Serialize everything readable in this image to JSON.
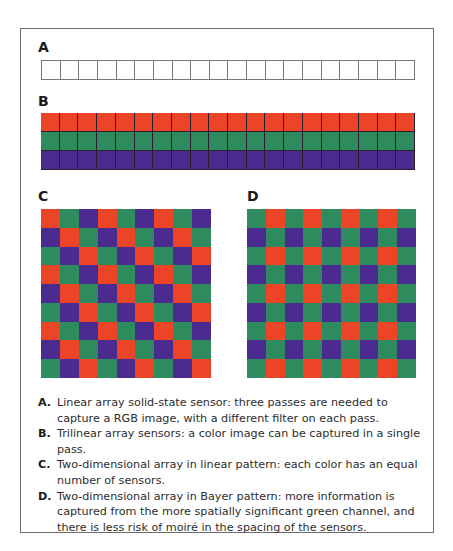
{
  "colors": {
    "red": "#ec4426",
    "green": "#2e8b5e",
    "purple": "#4b2b8f",
    "frame": "#6b6b6b"
  },
  "sections": {
    "a": {
      "label": "A",
      "cells": 20,
      "rows": 1
    },
    "b": {
      "label": "B",
      "cells": 20,
      "rows": [
        "red",
        "green",
        "purple"
      ]
    },
    "c": {
      "label": "C",
      "grid_size": 9,
      "pattern": "linear (diagonal R-G-P)"
    },
    "d": {
      "label": "D",
      "grid_size": 9,
      "pattern": "Bayer (G/R and P/G)"
    }
  },
  "captions": [
    {
      "letter": "A.",
      "text": "Linear array solid-state sensor: three passes are needed to capture a RGB image, with a different filter on each pass."
    },
    {
      "letter": "B.",
      "text": "Trilinear array sensors: a color image can be captured in a single pass."
    },
    {
      "letter": "C.",
      "text": "Two-dimensional array in linear pattern: each color has an equal number of sensors."
    },
    {
      "letter": "D.",
      "text": "Two-dimensional array in Bayer pattern: more information is captured from the more spatially significant green channel, and there is less risk of moiré in the spacing of the sensors."
    }
  ]
}
